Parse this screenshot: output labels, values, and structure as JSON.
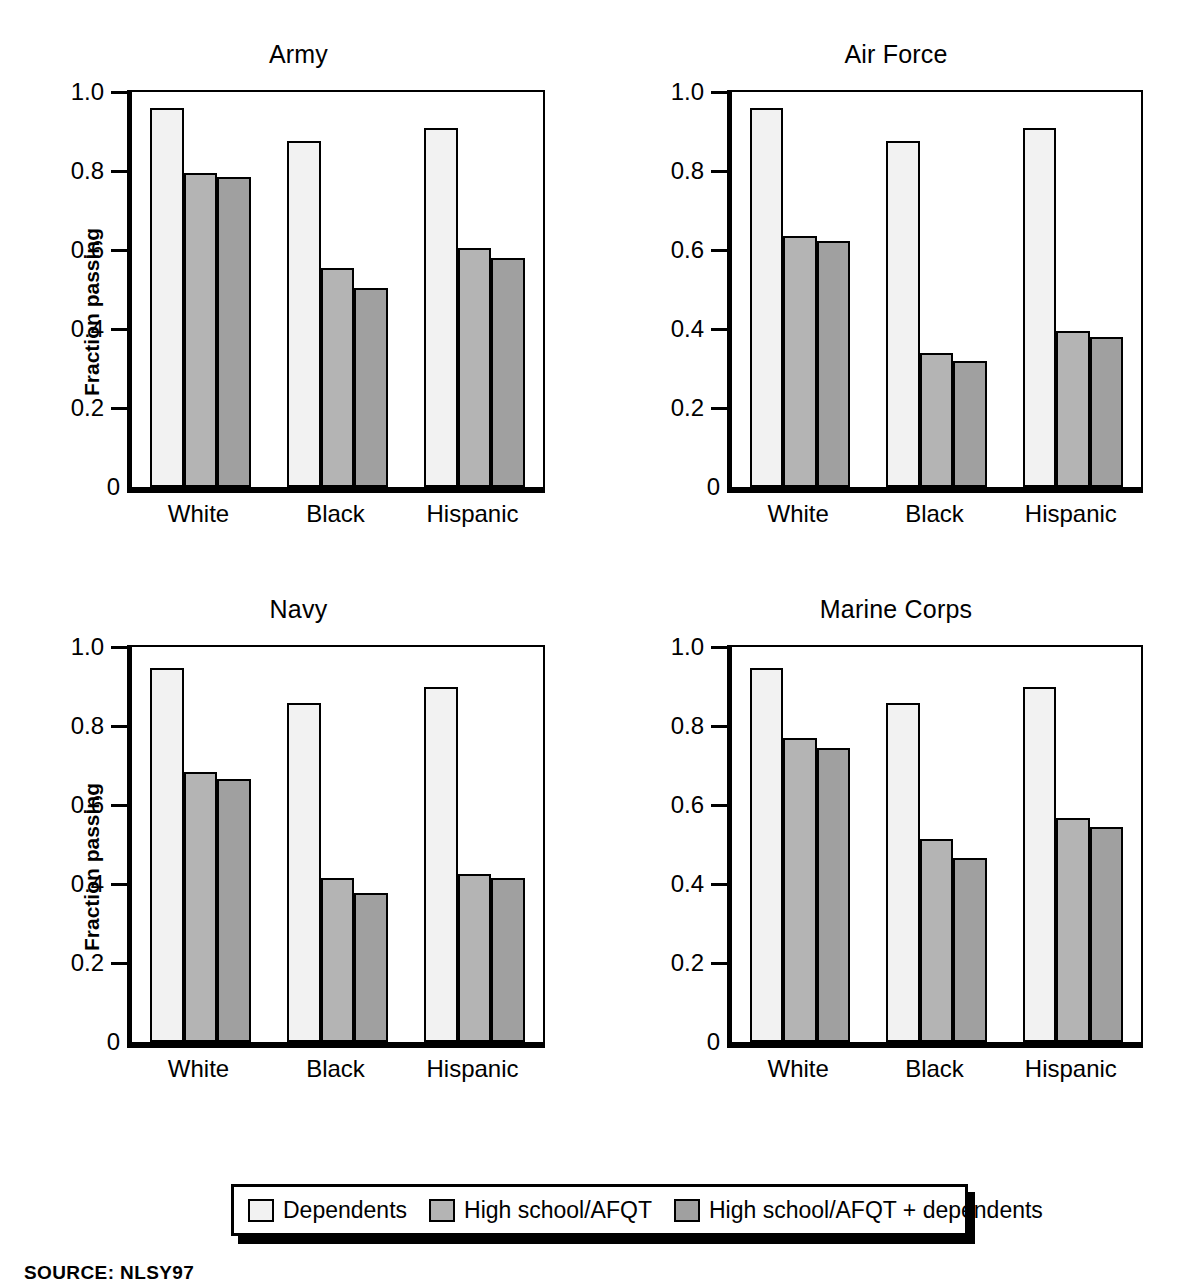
{
  "chart_data": {
    "type": "bar",
    "title": "",
    "ylabel": "Fraction passing",
    "xlabel": "",
    "ylim": [
      0,
      1.0
    ],
    "ytick_labels": [
      "0",
      "0.2",
      "0.4",
      "0.6",
      "0.8",
      "1.0"
    ],
    "ytick_values": [
      0,
      0.2,
      0.4,
      0.6,
      0.8,
      1.0
    ],
    "grid": false,
    "legend_position": "bottom-center",
    "categories": [
      "White",
      "Black",
      "Hispanic"
    ],
    "series_names": [
      "Dependents",
      "High school/AFQT",
      "High school/AFQT + dependents"
    ],
    "series_colors": [
      "#f2f2f2",
      "#b4b4b4",
      "#a0a0a0"
    ],
    "panels": [
      {
        "title": "Army",
        "series": [
          {
            "name": "Dependents",
            "values": [
              0.96,
              0.875,
              0.91
            ]
          },
          {
            "name": "High school/AFQT",
            "values": [
              0.795,
              0.555,
              0.605
            ]
          },
          {
            "name": "High school/AFQT + dependents",
            "values": [
              0.785,
              0.505,
              0.58
            ]
          }
        ]
      },
      {
        "title": "Air Force",
        "series": [
          {
            "name": "Dependents",
            "values": [
              0.96,
              0.875,
              0.91
            ]
          },
          {
            "name": "High school/AFQT",
            "values": [
              0.635,
              0.34,
              0.395
            ]
          },
          {
            "name": "High school/AFQT + dependents",
            "values": [
              0.622,
              0.318,
              0.379
            ]
          }
        ]
      },
      {
        "title": "Navy",
        "series": [
          {
            "name": "Dependents",
            "values": [
              0.948,
              0.858,
              0.898
            ]
          },
          {
            "name": "High school/AFQT",
            "values": [
              0.683,
              0.415,
              0.425
            ]
          },
          {
            "name": "High school/AFQT + dependents",
            "values": [
              0.667,
              0.378,
              0.415
            ]
          }
        ]
      },
      {
        "title": "Marine Corps",
        "series": [
          {
            "name": "Dependents",
            "values": [
              0.948,
              0.858,
              0.898
            ]
          },
          {
            "name": "High school/AFQT",
            "values": [
              0.77,
              0.515,
              0.568
            ]
          },
          {
            "name": "High school/AFQT + dependents",
            "values": [
              0.745,
              0.467,
              0.545
            ]
          }
        ]
      }
    ]
  },
  "legend": {
    "items": [
      {
        "label": "Dependents",
        "color": "#f2f2f2"
      },
      {
        "label": "High school/AFQT",
        "color": "#b4b4b4"
      },
      {
        "label": "High school/AFQT + dependents",
        "color": "#a0a0a0"
      }
    ]
  },
  "footer": {
    "source": "SOURCE: NLSY97"
  }
}
